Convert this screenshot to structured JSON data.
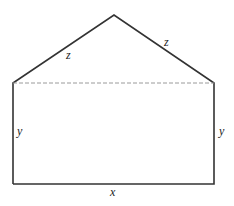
{
  "diagram": {
    "type": "geometric-figure",
    "colors": {
      "outline": "#333333",
      "dashed_line": "#9a9a9a",
      "label": "#222222",
      "background": "#ffffff"
    },
    "vertices": {
      "apex": [
        114,
        15
      ],
      "top_left": [
        13,
        83
      ],
      "top_right": [
        214,
        83
      ],
      "bottom_left": [
        13,
        184
      ],
      "bottom_right": [
        214,
        184
      ]
    },
    "labels": {
      "roof_left": "z",
      "roof_right": "z",
      "wall_left": "y",
      "wall_right": "y",
      "base": "x"
    }
  }
}
